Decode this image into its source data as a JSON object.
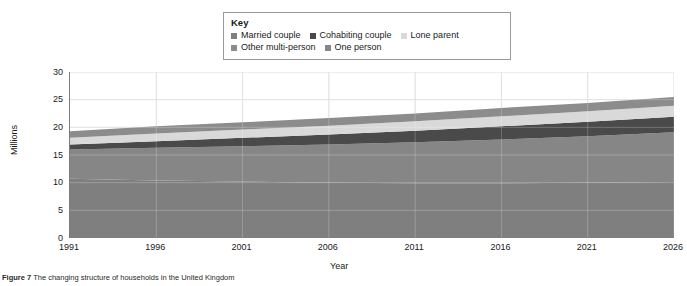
{
  "legend": {
    "title": "Key",
    "items": [
      {
        "label": "Married couple",
        "color": "#7f7f7f"
      },
      {
        "label": "Cohabiting couple",
        "color": "#4a4a4a"
      },
      {
        "label": "Lone parent",
        "color": "#d9d9d9"
      },
      {
        "label": "Other multi-person",
        "color": "#8c8c8c"
      },
      {
        "label": "One person",
        "color": "#868686"
      }
    ]
  },
  "caption": {
    "figure_number": "Figure 7",
    "text": "The changing structure of households in the United Kingdom"
  },
  "chart_data": {
    "type": "area",
    "title": "",
    "xlabel": "Year",
    "ylabel": "Millions",
    "xlim": [
      1991,
      2026
    ],
    "ylim": [
      0,
      30
    ],
    "xticks": [
      1991,
      1996,
      2001,
      2006,
      2011,
      2016,
      2021,
      2026
    ],
    "yticks": [
      0,
      5,
      10,
      15,
      20,
      25,
      30
    ],
    "grid": true,
    "stacked": true,
    "legend_position": "top-center",
    "x": [
      1991,
      1996,
      2001,
      2006,
      2011,
      2016,
      2021,
      2026
    ],
    "series": [
      {
        "name": "Married couple",
        "color": "#7f7f7f",
        "values": [
          10.7,
          10.4,
          10.2,
          10.0,
          9.9,
          9.9,
          10.0,
          10.1
        ]
      },
      {
        "name": "Cohabiting couple",
        "color": "#4a4a4a",
        "values": [
          0.9,
          1.2,
          1.5,
          1.8,
          2.1,
          2.4,
          2.6,
          2.8
        ]
      },
      {
        "name": "Lone parent",
        "color": "#d9d9d9",
        "values": [
          1.2,
          1.4,
          1.5,
          1.6,
          1.7,
          1.8,
          1.9,
          2.0
        ]
      },
      {
        "name": "Other multi-person",
        "color": "#8c8c8c",
        "values": [
          1.2,
          1.3,
          1.3,
          1.4,
          1.4,
          1.5,
          1.5,
          1.6
        ]
      },
      {
        "name": "One person",
        "color": "#868686",
        "values": [
          5.3,
          5.9,
          6.4,
          6.9,
          7.4,
          7.9,
          8.4,
          9.0
        ]
      }
    ],
    "totals": [
      19.3,
      20.2,
      20.9,
      21.7,
      22.5,
      23.5,
      24.4,
      25.5
    ]
  }
}
